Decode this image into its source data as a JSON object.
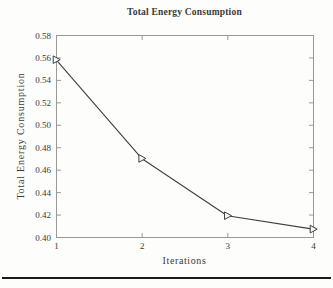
{
  "page": {
    "background": "#fdfdfb",
    "footer_rule_color": "#1b1b1b"
  },
  "chart_data": {
    "type": "line",
    "title": "Total Energy Consumption",
    "xlabel": "Iterations",
    "ylabel": "Total Energy Consumption",
    "x": [
      1,
      2,
      3,
      4
    ],
    "y": [
      0.558,
      0.47,
      0.419,
      0.407
    ],
    "series_name": "Total Energy Consumption",
    "xlim": [
      1,
      4
    ],
    "ylim": [
      0.4,
      0.58
    ],
    "xticks": [
      "1",
      "2",
      "3",
      "4"
    ],
    "yticks": [
      "0.40",
      "0.42",
      "0.44",
      "0.46",
      "0.48",
      "0.50",
      "0.52",
      "0.54",
      "0.56",
      "0.58"
    ],
    "grid": false,
    "legend": null,
    "marker": "right-triangle",
    "marker_style": "open",
    "colors": {
      "line": "#3f3f3f",
      "marker_edge": "#3f3f3f",
      "marker_fill": "#f7f7f4",
      "frame": "#999996",
      "tick_text": "#3a3a38"
    }
  }
}
